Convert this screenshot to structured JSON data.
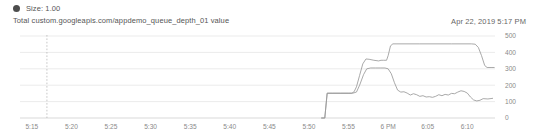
{
  "legend": {
    "marker_icon": "filled-circle-marker",
    "label": "Size: 1.00",
    "marker_color": "#4d4d4d"
  },
  "series_title": "Total custom.googleapis.com/appdemo_queue_depth_01 value",
  "timestamp": "Apr 22, 2019 5:17 PM",
  "chart_data": {
    "type": "line",
    "title": "Total custom.googleapis.com/appdemo_queue_depth_01 value",
    "xlabel": "",
    "ylabel": "",
    "ylim": [
      0,
      500
    ],
    "yticks": [
      0,
      100,
      200,
      300,
      400,
      500
    ],
    "ytick_labels": [
      "0",
      "100",
      "200",
      "300",
      "400",
      "500"
    ],
    "grid": true,
    "legend_position": "top-left",
    "y_axis_side": "right",
    "xtick_labels": [
      "5:15",
      "5:20",
      "5:25",
      "5:30",
      "5:35",
      "5:40",
      "5:45",
      "5:50",
      "5:55",
      "6 PM",
      "6:05",
      "6:10"
    ],
    "x_minutes": [
      315,
      320,
      325,
      330,
      335,
      340,
      345,
      350,
      355,
      360,
      365,
      370
    ],
    "xlim_minutes": [
      313.5,
      373.5
    ],
    "annotations": [
      {
        "type": "vertical-dashed-line",
        "name": "current-time-marker",
        "x_minutes": 316.9
      }
    ],
    "series": [
      {
        "name": "queue-depth-upper",
        "color": "#9a9a9a",
        "points": [
          [
            351.6,
            0
          ],
          [
            352.0,
            0
          ],
          [
            352.3,
            150
          ],
          [
            355.4,
            150
          ],
          [
            355.7,
            160
          ],
          [
            356.0,
            190
          ],
          [
            356.4,
            260
          ],
          [
            356.8,
            330
          ],
          [
            357.2,
            360
          ],
          [
            357.6,
            358
          ],
          [
            358.2,
            352
          ],
          [
            358.8,
            348
          ],
          [
            359.1,
            352
          ],
          [
            359.4,
            352
          ],
          [
            359.8,
            352
          ],
          [
            360.0,
            380
          ],
          [
            360.3,
            440
          ],
          [
            360.6,
            452
          ],
          [
            361.0,
            452
          ],
          [
            364.0,
            452
          ],
          [
            368.0,
            452
          ],
          [
            370.5,
            452
          ],
          [
            371.0,
            450
          ],
          [
            371.4,
            430
          ],
          [
            371.8,
            380
          ],
          [
            372.2,
            320
          ],
          [
            372.5,
            308
          ],
          [
            373.0,
            308
          ],
          [
            373.4,
            308
          ]
        ]
      },
      {
        "name": "queue-depth-lower",
        "color": "#9a9a9a",
        "points": [
          [
            351.6,
            0
          ],
          [
            352.0,
            0
          ],
          [
            352.3,
            152
          ],
          [
            353.0,
            152
          ],
          [
            354.0,
            152
          ],
          [
            355.0,
            152
          ],
          [
            355.6,
            152
          ],
          [
            356.0,
            158
          ],
          [
            356.4,
            200
          ],
          [
            356.9,
            265
          ],
          [
            357.3,
            300
          ],
          [
            357.8,
            305
          ],
          [
            358.4,
            305
          ],
          [
            359.0,
            305
          ],
          [
            359.6,
            305
          ],
          [
            360.0,
            300
          ],
          [
            360.4,
            270
          ],
          [
            360.8,
            215
          ],
          [
            361.2,
            170
          ],
          [
            361.6,
            158
          ],
          [
            362.0,
            160
          ],
          [
            362.4,
            152
          ],
          [
            362.8,
            140
          ],
          [
            363.2,
            148
          ],
          [
            363.6,
            142
          ],
          [
            364.0,
            132
          ],
          [
            364.4,
            136
          ],
          [
            364.8,
            128
          ],
          [
            365.2,
            130
          ],
          [
            365.6,
            126
          ],
          [
            366.0,
            132
          ],
          [
            366.4,
            142
          ],
          [
            366.8,
            136
          ],
          [
            367.2,
            144
          ],
          [
            367.6,
            140
          ],
          [
            368.0,
            150
          ],
          [
            368.4,
            148
          ],
          [
            368.8,
            158
          ],
          [
            369.2,
            166
          ],
          [
            369.6,
            162
          ],
          [
            370.0,
            152
          ],
          [
            370.4,
            128
          ],
          [
            370.8,
            110
          ],
          [
            371.2,
            104
          ],
          [
            371.6,
            108
          ],
          [
            372.0,
            118
          ],
          [
            372.6,
            116
          ],
          [
            373.2,
            120
          ]
        ]
      }
    ]
  }
}
